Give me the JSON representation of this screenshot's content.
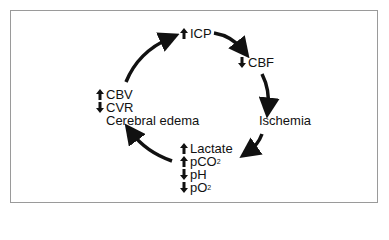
{
  "diagram": {
    "type": "cycle",
    "nodes": [
      {
        "id": "icp",
        "items": [
          {
            "dir": "up",
            "label": "ICP"
          }
        ]
      },
      {
        "id": "cbf",
        "items": [
          {
            "dir": "down",
            "label": "CBF"
          }
        ]
      },
      {
        "id": "ischemia",
        "items": [
          {
            "dir": "",
            "label": "Ischemia"
          }
        ]
      },
      {
        "id": "metabolic",
        "items": [
          {
            "dir": "up",
            "label": "Lactate"
          },
          {
            "dir": "up",
            "label": "pCO",
            "sub": "2"
          },
          {
            "dir": "down",
            "label": "pH"
          },
          {
            "dir": "down",
            "label": "pO",
            "sub": "2"
          }
        ]
      },
      {
        "id": "vascular",
        "items": [
          {
            "dir": "up",
            "label": "CBV"
          },
          {
            "dir": "down",
            "label": "CVR"
          },
          {
            "dir": "",
            "label": "Cerebral edema"
          }
        ]
      }
    ],
    "edges": [
      {
        "from": "icp",
        "to": "cbf"
      },
      {
        "from": "cbf",
        "to": "ischemia"
      },
      {
        "from": "ischemia",
        "to": "metabolic"
      },
      {
        "from": "metabolic",
        "to": "vascular"
      },
      {
        "from": "vascular",
        "to": "icp"
      }
    ],
    "colors": {
      "ink": "#111111",
      "frame": "#9a9a9a",
      "background": "#ffffff"
    }
  }
}
